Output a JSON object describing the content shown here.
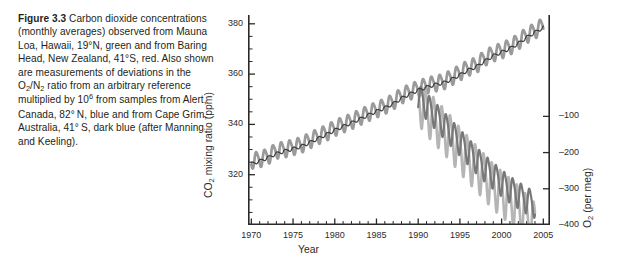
{
  "figure": {
    "label": "Figure 3.3",
    "caption_text": "Carbon dioxide concentrations (monthly averages) observed from Mauna Loa, Hawaii, 19°N, green and from Baring Head, New Zealand, 41°S, red. Also shown are measurements of deviations in the O2/N2 ratio from an arbitrary reference multiplied by 106 from samples from Alert, Canada, 82°N, blue and from Cape Grim, Australia, 41°S, dark blue (after Manning and Keeling).",
    "caption_segments": [
      {
        "kind": "bold",
        "text": "Figure 3.3"
      },
      {
        "kind": "plain",
        "text": "  Carbon dioxide concentrations (monthly averages) observed from Mauna Loa, Hawaii, 19°N, green and from Baring Head, New Zealand, 41°S, red. Also shown are measurements of deviations in the O"
      },
      {
        "kind": "sub",
        "text": "2"
      },
      {
        "kind": "plain",
        "text": "/N"
      },
      {
        "kind": "sub",
        "text": "2"
      },
      {
        "kind": "plain",
        "text": " ratio from an arbitrary reference multiplied by 10"
      },
      {
        "kind": "sup",
        "text": "6"
      },
      {
        "kind": "plain",
        "text": " from samples from Alert, Canada, 82° N, blue and from Cape Grim, Australia, 41° S, dark blue (after Manning and Keeling)."
      }
    ]
  },
  "axes": {
    "x": {
      "title": "Year",
      "major_ticks": [
        1970,
        1975,
        1980,
        1985,
        1990,
        1995,
        2000,
        2005
      ],
      "major_tick_labels": [
        "1970",
        "1975",
        "1980",
        "1985",
        "1990",
        "1995",
        "2000",
        "2005"
      ],
      "minor_tick_step": 1,
      "range": [
        1969.6,
        2005.8
      ]
    },
    "y_left": {
      "title_text": "CO2 mixing ratio (ppm)",
      "title_prefix": "CO",
      "title_sub": "2",
      "title_suffix": " mixing ratio (ppm)",
      "major_ticks": [
        320,
        340,
        360,
        380
      ],
      "major_tick_labels": [
        "320",
        "340",
        "360",
        "380"
      ],
      "minor_tick_step": 5,
      "range": [
        300,
        383.5
      ],
      "unit": "ppm"
    },
    "y_right": {
      "title_text": "O2 (per meg)",
      "title_prefix": "O",
      "title_sub": "2",
      "title_suffix": " (per meg)",
      "major_ticks": [
        -100,
        -200,
        -300,
        -400
      ],
      "major_tick_labels": [
        "–100",
        "–200",
        "–300",
        "–400"
      ],
      "range": [
        -400,
        180
      ],
      "unit": "per meg"
    }
  },
  "colors": {
    "co2_mauna_loa": "#9a9a9a",
    "co2_baring_head": "#3e3e3e",
    "o2_alert": "#b5b5b5",
    "o2_cape_grim": "#787878",
    "axis": "#2a2a2a",
    "text": "#231f20",
    "background": "#ffffff"
  },
  "chart_data": {
    "type": "line",
    "xlabel": "Year",
    "ylabel": "CO2 mixing ratio (ppm)",
    "ylabel_secondary": "O2 (per meg)",
    "xlim": [
      1969.6,
      2005.8
    ],
    "ylim": [
      300,
      383.5
    ],
    "ylim_secondary": [
      -400,
      180
    ],
    "grid": false,
    "legend": "none-in-figure (described in caption)",
    "seasonal_cycle": {
      "co2_mauna_loa_peak_to_peak_ppm": 6.0,
      "co2_mauna_loa_phase_peak_month": "May",
      "co2_baring_head_peak_to_peak_ppm": 1.2,
      "o2_alert_peak_to_peak_permeg": 120,
      "o2_cape_grim_peak_to_peak_permeg": 70
    },
    "series": [
      {
        "name": "CO2 Mauna Loa, Hawaii, 19°N",
        "color_in_original": "green",
        "color_rendered": "#9a9a9a",
        "axis": "left",
        "units": "ppm",
        "x": [
          1970,
          1971,
          1972,
          1973,
          1974,
          1975,
          1976,
          1977,
          1978,
          1979,
          1980,
          1981,
          1982,
          1983,
          1984,
          1985,
          1986,
          1987,
          1988,
          1989,
          1990,
          1991,
          1992,
          1993,
          1994,
          1995,
          1996,
          1997,
          1998,
          1999,
          2000,
          2001,
          2002,
          2003,
          2004,
          2005
        ],
        "values": [
          325.7,
          326.3,
          327.5,
          329.7,
          330.2,
          331.1,
          332.0,
          333.8,
          335.4,
          336.8,
          338.7,
          340.1,
          341.4,
          343.0,
          344.6,
          346.0,
          347.4,
          349.2,
          351.6,
          353.1,
          354.4,
          355.6,
          356.4,
          357.1,
          358.8,
          360.8,
          362.6,
          363.8,
          366.6,
          368.3,
          369.5,
          371.0,
          373.1,
          375.6,
          377.4,
          379.6
        ]
      },
      {
        "name": "CO2 Baring Head, New Zealand, 41°S",
        "color_in_original": "red",
        "color_rendered": "#3e3e3e",
        "axis": "left",
        "units": "ppm",
        "x": [
          1970,
          1971,
          1972,
          1973,
          1974,
          1975,
          1976,
          1977,
          1978,
          1979,
          1980,
          1981,
          1982,
          1983,
          1984,
          1985,
          1986,
          1987,
          1988,
          1989,
          1990,
          1991,
          1992,
          1993,
          1994,
          1995,
          1996,
          1997,
          1998,
          1999,
          2000,
          2001,
          2002,
          2003,
          2004,
          2005
        ],
        "values": [
          324.3,
          325.4,
          326.8,
          328.4,
          329.4,
          330.3,
          331.3,
          332.8,
          334.4,
          336.0,
          337.7,
          339.2,
          340.6,
          342.1,
          343.7,
          345.2,
          346.6,
          348.2,
          350.4,
          352.1,
          353.6,
          354.8,
          355.8,
          356.5,
          357.9,
          359.7,
          361.6,
          363.0,
          365.2,
          367.3,
          368.7,
          370.2,
          372.2,
          374.6,
          376.6,
          378.5
        ]
      },
      {
        "name": "O2/N2 Alert, Canada, 82°N",
        "color_in_original": "blue",
        "color_rendered": "#b5b5b5",
        "axis": "right",
        "units": "per meg",
        "x": [
          1990,
          1991,
          1992,
          1993,
          1994,
          1995,
          1996,
          1997,
          1998,
          1999,
          2000,
          2001,
          2002,
          2003,
          2004
        ],
        "values": [
          -55,
          -85,
          -110,
          -135,
          -160,
          -190,
          -215,
          -240,
          -265,
          -290,
          -310,
          -330,
          -350,
          -375,
          -398
        ]
      },
      {
        "name": "O2/N2 Cape Grim, Australia, 41°S",
        "color_in_original": "dark blue",
        "color_rendered": "#787878",
        "axis": "right",
        "units": "per meg",
        "x": [
          1990,
          1991,
          1992,
          1993,
          1994,
          1995,
          1996,
          1997,
          1998,
          1999,
          2000,
          2001,
          2002,
          2003,
          2004
        ],
        "values": [
          -45,
          -70,
          -95,
          -120,
          -145,
          -170,
          -195,
          -220,
          -242,
          -262,
          -282,
          -300,
          -315,
          -330,
          -342
        ]
      }
    ]
  }
}
